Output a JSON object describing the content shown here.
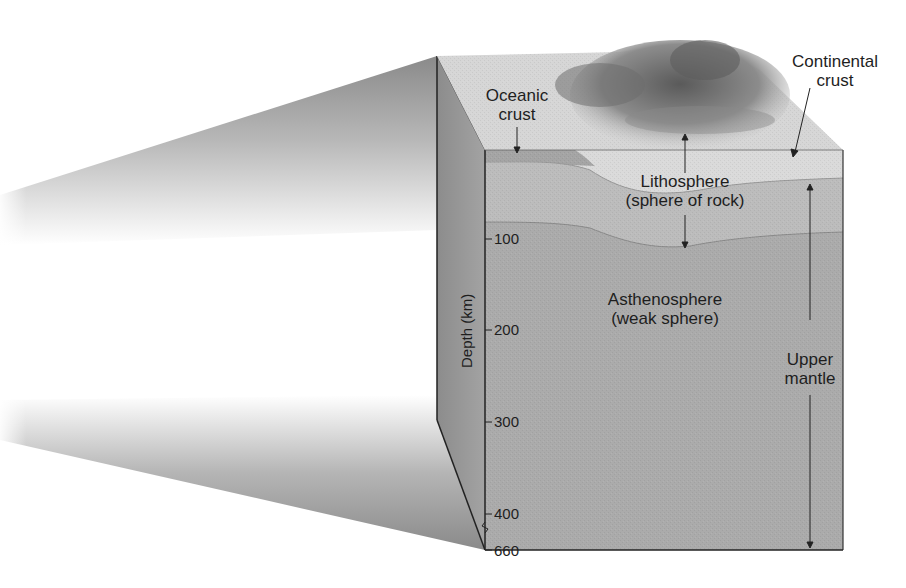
{
  "diagram": {
    "type": "block-diagram",
    "labels": {
      "oceanic_crust": [
        "Oceanic",
        "crust"
      ],
      "continental_crust": [
        "Continental",
        "crust"
      ],
      "lithosphere": [
        "Lithosphere",
        "(sphere of rock)"
      ],
      "asthenosphere": [
        "Asthenosphere",
        "(weak sphere)"
      ],
      "upper_mantle": [
        "Upper",
        "mantle"
      ]
    },
    "axis": {
      "title": "Depth (km)",
      "ticks": [
        "100",
        "200",
        "300",
        "400",
        "660"
      ],
      "axis_break": "between 400 and 660"
    },
    "colors": {
      "background": "#ffffff",
      "top_surface": "#d8d8d8",
      "mountains": "#7a7a7a",
      "crust_layer": "#dcdcdc",
      "oceanic_crust_band": "#a9a9a9",
      "lithosphere_mantle": "#bdbdbd",
      "asthenosphere": "#ababab",
      "side_face": "#9a9a9a",
      "lines": "#222222"
    }
  }
}
